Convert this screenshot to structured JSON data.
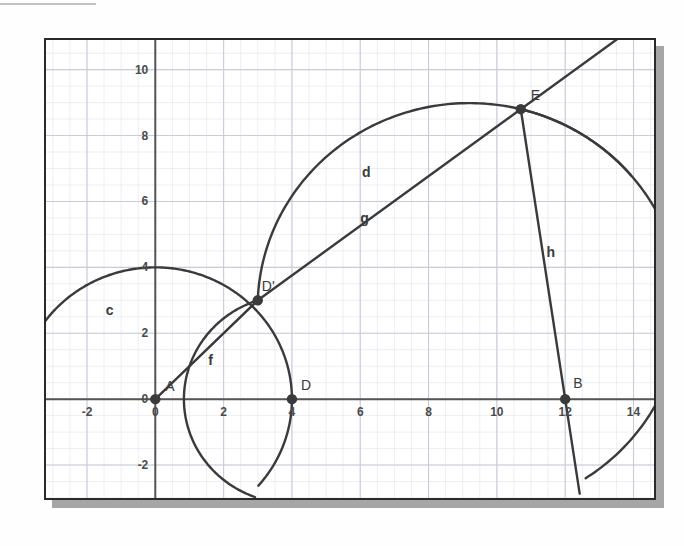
{
  "chart_data": {
    "type": "scatter",
    "title": "",
    "xlabel": "",
    "ylabel": "",
    "xlim": [
      -3.2,
      14.6
    ],
    "ylim": [
      -3.0,
      10.9
    ],
    "grid": true,
    "minor_grid": true,
    "legend": "none",
    "x_ticks": [
      -2,
      0,
      2,
      4,
      6,
      8,
      10,
      12,
      14
    ],
    "x_tick_labels": [
      "-2",
      "0",
      "2",
      "4",
      "6",
      "8",
      "10",
      "12",
      "14"
    ],
    "y_ticks": [
      -2,
      0,
      2,
      4,
      6,
      8,
      10
    ],
    "y_tick_labels": [
      "-2",
      "0",
      "2",
      "4",
      "6",
      "8",
      "10"
    ],
    "points": [
      {
        "name": "A",
        "label": "A",
        "x": 0,
        "y": 0,
        "label_dx": 10,
        "label_dy": -8
      },
      {
        "name": "D",
        "label": "D",
        "x": 4,
        "y": 0,
        "label_dx": 9,
        "label_dy": -9
      },
      {
        "name": "B",
        "label": "B",
        "x": 12,
        "y": 0,
        "label_dx": 8,
        "label_dy": -11
      },
      {
        "name": "Dprime",
        "label": "D'",
        "x": 3,
        "y": 3,
        "label_dx": 4,
        "label_dy": -9
      },
      {
        "name": "E",
        "label": "E",
        "x": 10.7,
        "y": 8.8,
        "label_dx": 10,
        "label_dy": -9
      }
    ],
    "circles": [
      {
        "name": "c",
        "label": "c",
        "cx": 0,
        "cy": 0,
        "r": 4,
        "label_x": -1.45,
        "label_y": 2.55
      },
      {
        "name": "small-arc-through-D",
        "label": "",
        "cx": 0,
        "cy": 0,
        "r": 0,
        "label_x": 0,
        "label_y": 0
      },
      {
        "name": "d",
        "label": "d",
        "cx": 3,
        "cy": 3,
        "r": 9.5,
        "label_x": 6.05,
        "label_y": 6.75
      }
    ],
    "segments": [
      {
        "name": "f",
        "label": "f",
        "x1": 0,
        "y1": 0,
        "x2": 3,
        "y2": 3,
        "label_x": 1.55,
        "label_y": 1.05
      },
      {
        "name": "g",
        "label": "g",
        "x1": 3,
        "y1": 3,
        "x2": 10.7,
        "y2": 8.8,
        "label_x": 6.0,
        "label_y": 5.35
      },
      {
        "name": "h",
        "label": "h",
        "x1": 10.7,
        "y1": 8.8,
        "x2": 12,
        "y2": 0,
        "label_x": 11.45,
        "label_y": 4.3
      }
    ],
    "arcs_described": [
      "circle c centered at A(0,0) radius 4",
      "arc centered at D(4,0) radius ~3.0 passing through D'(3,3)",
      "arc centered at A(0,0) radius 4 through D'(3,3) continuing down",
      "circle d centered near D'(3,3) large radius through E(10.7,8.8) and near B(12,0)",
      "line g from D' to E extended beyond E upward-left",
      "line h from E to B extended below axis"
    ]
  },
  "point_marker_color": "#3a3a3a",
  "curve_color": "#3a3a3a",
  "axis_color": "#555555",
  "grid_color": "#c8ccd8",
  "minor_grid_color": "#e4e7ef",
  "frame_color": "#2a2a2a",
  "shadow_color": "#a6a6a6",
  "background_color": "#ffffff"
}
